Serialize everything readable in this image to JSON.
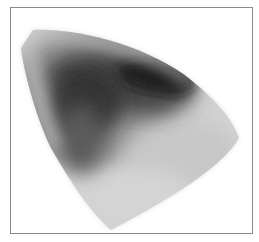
{
  "image": {
    "kind": "grayscale density plot",
    "frame": {
      "border_color": "#8a8a8a",
      "background": "#ffffff"
    },
    "colors": {
      "darkest": "#141414",
      "dark": "#3a3a3a",
      "mid": "#7a7a7a",
      "light": "#bdbdbd",
      "faint": "#e6e6e6"
    }
  }
}
